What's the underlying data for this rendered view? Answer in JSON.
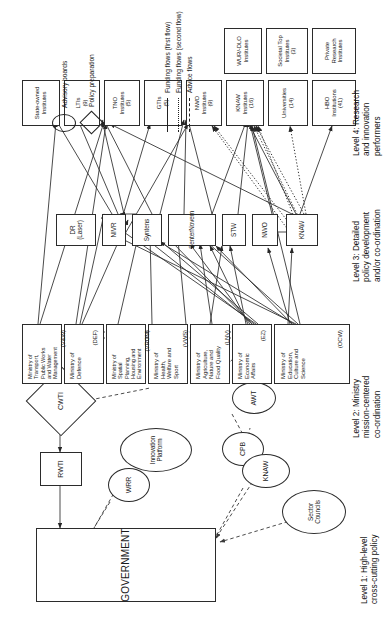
{
  "diagram": {
    "orientation": "rotated-90",
    "levels": [
      {
        "id": "level1",
        "label": "Level 1: High-level\ncross-cutting policy"
      },
      {
        "id": "level2",
        "label": "Level 2: Ministry\nmission-centered\nco-ordination"
      },
      {
        "id": "level3",
        "label": "Level 3: Detailed\npolicy development\nand/or co-ordination"
      },
      {
        "id": "level4",
        "label": "Level 4: Research\nand innovation\nperformers"
      }
    ],
    "government": {
      "label": "GOVERNMENT"
    },
    "level1_nodes": [
      {
        "id": "rwti",
        "label": "RWTI",
        "shape": "rect"
      },
      {
        "id": "cwti",
        "label": "CWTI",
        "shape": "diamond"
      },
      {
        "id": "wrr",
        "label": "WRR",
        "shape": "ellipse"
      },
      {
        "id": "innovation_platform",
        "label": "Innovation\nPlatform",
        "shape": "ellipse"
      },
      {
        "id": "cpb",
        "label": "CPB",
        "shape": "ellipse"
      },
      {
        "id": "awt",
        "label": "AWT",
        "shape": "ellipse"
      },
      {
        "id": "knaw_adv",
        "label": "KNAW",
        "shape": "ellipse"
      },
      {
        "id": "sector_councils",
        "label": "Sector\nCouncils",
        "shape": "ellipse"
      }
    ],
    "ministries": [
      {
        "id": "ocw",
        "name": "Ministry of\nEducation,\nCulture and\nScience",
        "abbr": "(OCW)"
      },
      {
        "id": "ez",
        "name": "Ministry of\nEconomic\nAffairs",
        "abbr": "(EZ)"
      },
      {
        "id": "lnv",
        "name": "Ministry of\nAgriculture,\nNature and\nFood Quality",
        "abbr": "(LNV)"
      },
      {
        "id": "vws",
        "name": "Ministry of\nHealth,\nWelfare and\nSport",
        "abbr": "(VWS)"
      },
      {
        "id": "vrom",
        "name": "Ministry of\nSpatial\nPlanning,\nHousing and\nEnvironment",
        "abbr": "(VROM)"
      },
      {
        "id": "def",
        "name": "Ministry of\nDefence",
        "abbr": "(DEF)"
      },
      {
        "id": "vw",
        "name": "Ministry of\nTransport,\nPublic Works\nand Water\nManagement",
        "abbr": "(V&W)"
      }
    ],
    "agencies": [
      {
        "id": "knaw_ag",
        "label": "KNAW"
      },
      {
        "id": "nwo_ag",
        "label": "NWO"
      },
      {
        "id": "stw",
        "label": "STW"
      },
      {
        "id": "senternovem",
        "label": "SenterNovem"
      },
      {
        "id": "syntens",
        "label": "Syntens"
      },
      {
        "id": "nivr",
        "label": "NIVR"
      },
      {
        "id": "dr_laser",
        "label": "DR (Laser)"
      }
    ],
    "performers": [
      {
        "id": "hbo",
        "label": "HBO\nInstitutions\n(41)"
      },
      {
        "id": "universities",
        "label": "Universities\n(14)"
      },
      {
        "id": "knaw_inst",
        "label": "KNAW\nInstitutes\n(16)"
      },
      {
        "id": "nwo_inst",
        "label": "NWO\nInstitutes\n(9)"
      },
      {
        "id": "gtis",
        "label": "GTIs\n(5)"
      },
      {
        "id": "tno",
        "label": "TNO\nInstitutes\n(5)"
      },
      {
        "id": "ltis",
        "label": "LTIs\n(9)"
      },
      {
        "id": "state_owned",
        "label": "State-owned\nInstitutes"
      },
      {
        "id": "wur_dlo",
        "label": "WUR/-DLO\nInstitutes"
      },
      {
        "id": "societal_top",
        "label": "Societal Top\nInstitutes\n(3)"
      },
      {
        "id": "private_research",
        "label": "Private\nResearch\nInstitutes"
      }
    ],
    "legend": {
      "flows": [
        {
          "id": "funding_first",
          "label": "Funding flows (first flow)",
          "style": "solid"
        },
        {
          "id": "funding_second",
          "label": "Funding flows (second flow)",
          "style": "dotted"
        },
        {
          "id": "advice",
          "label": "Advice flows",
          "style": "dashed"
        }
      ],
      "shapes": [
        {
          "id": "advisory_boards",
          "label": "Advisory boards",
          "shape": "ellipse"
        },
        {
          "id": "policy_preparation",
          "label": "Policy preparation",
          "shape": "diamond"
        }
      ]
    },
    "colors": {
      "stroke": "#2b2b2b",
      "text": "#1a1a1a",
      "background": "#ffffff"
    }
  }
}
